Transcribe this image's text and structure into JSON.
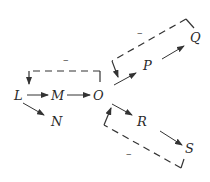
{
  "diagram": {
    "type": "pathway-with-feedback-inhibition",
    "nodes": [
      {
        "id": "L",
        "label": "L",
        "x": 20,
        "y": 99
      },
      {
        "id": "M",
        "label": "M",
        "x": 57,
        "y": 99
      },
      {
        "id": "N",
        "label": "N",
        "x": 57,
        "y": 125
      },
      {
        "id": "O",
        "label": "O",
        "x": 99,
        "y": 99
      },
      {
        "id": "P",
        "label": "P",
        "x": 148,
        "y": 69
      },
      {
        "id": "Q",
        "label": "Q",
        "x": 195,
        "y": 41
      },
      {
        "id": "R",
        "label": "R",
        "x": 142,
        "y": 125
      },
      {
        "id": "S",
        "label": "S",
        "x": 189,
        "y": 152
      }
    ],
    "edges": [
      {
        "from": "L",
        "to": "M"
      },
      {
        "from": "M",
        "to": "O"
      },
      {
        "from": "L",
        "to": "N"
      },
      {
        "from": "O",
        "to": "P"
      },
      {
        "from": "P",
        "to": "Q"
      },
      {
        "from": "O",
        "to": "R"
      },
      {
        "from": "R",
        "to": "S"
      }
    ],
    "feedback": [
      {
        "from": "O",
        "to": "L->M",
        "sign": "–"
      },
      {
        "from": "Q",
        "to": "O->P",
        "sign": "–"
      },
      {
        "from": "S",
        "to": "O->R",
        "sign": "–"
      }
    ]
  },
  "labels": {
    "L": "L",
    "M": "M",
    "N": "N",
    "O": "O",
    "P": "P",
    "Q": "Q",
    "R": "R",
    "S": "S",
    "sign1": "–",
    "sign2": "–",
    "sign3": "–"
  }
}
